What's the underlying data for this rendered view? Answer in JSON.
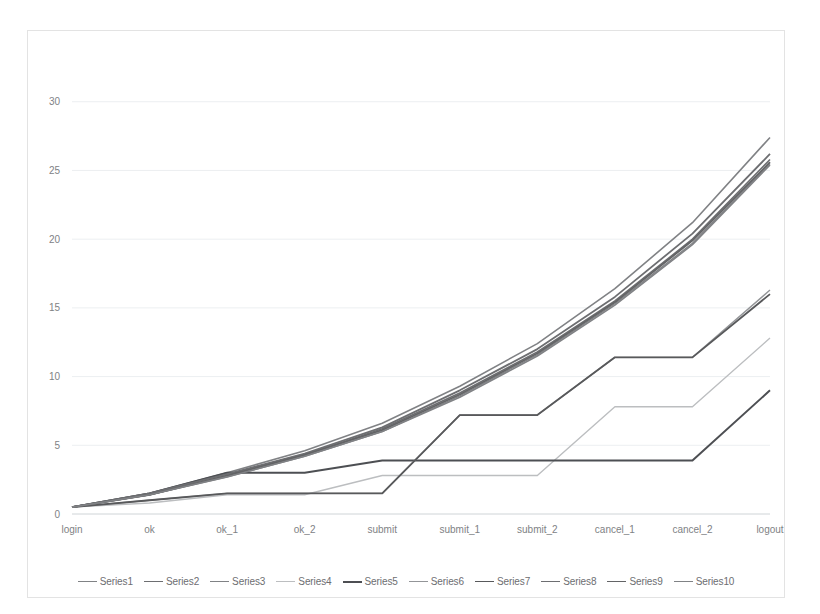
{
  "chart_data": {
    "type": "line",
    "title": "",
    "subtitle": "",
    "xlabel": "",
    "ylabel": "",
    "categories": [
      "login",
      "ok",
      "ok_1",
      "ok_2",
      "submit",
      "submit_1",
      "submit_2",
      "cancel_1",
      "cancel_2",
      "logout"
    ],
    "ylim": [
      0,
      31
    ],
    "yticks": [
      0,
      5,
      10,
      15,
      20,
      25,
      30
    ],
    "ytick_labels": [
      "0",
      "5",
      "10",
      "15",
      "20",
      "25",
      "30"
    ],
    "grid": true,
    "grid_axis": "y",
    "legend_position": "bottom",
    "series": [
      {
        "name": "Series1",
        "color": "#808285",
        "width": 1.6,
        "values": [
          0.5,
          1.5,
          3.0,
          4.6,
          6.6,
          9.3,
          12.4,
          16.4,
          21.2,
          27.4
        ]
      },
      {
        "name": "Series2",
        "color": "#6d6e71",
        "width": 1.6,
        "values": [
          0.5,
          1.4,
          2.8,
          4.3,
          6.2,
          8.8,
          11.8,
          15.5,
          20.0,
          25.8
        ]
      },
      {
        "name": "Series3",
        "color": "#808285",
        "width": 1.4,
        "values": [
          0.5,
          1.4,
          2.7,
          4.2,
          6.0,
          8.6,
          11.6,
          15.3,
          19.7,
          25.5
        ]
      },
      {
        "name": "Series4",
        "color": "#bcbec0",
        "width": 1.4,
        "values": [
          0.5,
          0.8,
          1.4,
          1.4,
          2.8,
          2.8,
          2.8,
          7.8,
          7.8,
          12.8
        ]
      },
      {
        "name": "Series5",
        "color": "#4d4f53",
        "width": 2.0,
        "values": [
          0.5,
          1.5,
          3.0,
          3.0,
          3.9,
          3.9,
          3.9,
          3.9,
          3.9,
          9.0
        ]
      },
      {
        "name": "Series6",
        "color": "#939598",
        "width": 1.4,
        "values": [
          0.5,
          1.0,
          1.5,
          1.5,
          1.5,
          7.2,
          7.2,
          11.4,
          11.4,
          16.3
        ]
      },
      {
        "name": "Series7",
        "color": "#58595b",
        "width": 1.8,
        "values": [
          0.5,
          1.0,
          1.5,
          1.5,
          1.5,
          7.2,
          7.2,
          11.4,
          11.4,
          16.0
        ]
      },
      {
        "name": "Series8",
        "color": "#6d6e71",
        "width": 1.8,
        "values": [
          0.5,
          1.5,
          2.9,
          4.4,
          6.3,
          9.0,
          12.0,
          15.8,
          20.4,
          26.2
        ]
      },
      {
        "name": "Series9",
        "color": "#636466",
        "width": 1.8,
        "values": [
          0.5,
          1.4,
          2.8,
          4.3,
          6.1,
          8.7,
          11.7,
          15.4,
          19.9,
          25.6
        ]
      },
      {
        "name": "Series10",
        "color": "#808285",
        "width": 1.6,
        "values": [
          0.5,
          1.4,
          2.7,
          4.2,
          6.0,
          8.5,
          11.5,
          15.2,
          19.6,
          25.4
        ]
      }
    ]
  },
  "legend": {
    "items": [
      {
        "label": "Series1"
      },
      {
        "label": "Series2"
      },
      {
        "label": "Series3"
      },
      {
        "label": "Series4"
      },
      {
        "label": "Series5"
      },
      {
        "label": "Series6"
      },
      {
        "label": "Series7"
      },
      {
        "label": "Series8"
      },
      {
        "label": "Series9"
      },
      {
        "label": "Series10"
      }
    ]
  },
  "colors": {
    "grid": "#eceff1",
    "axis": "#d9dcde",
    "tick_text": "#808285",
    "card_border": "#e3e3e3",
    "background": "#ffffff"
  }
}
